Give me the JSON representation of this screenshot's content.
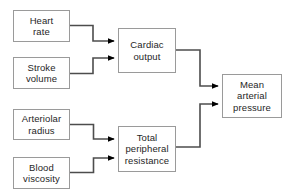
{
  "diagram": {
    "type": "flowchart",
    "canvas": {
      "width": 287,
      "height": 196,
      "background": "#ffffff"
    },
    "style": {
      "box_border_color": "#9a9a9a",
      "box_fill_color": "#ffffff",
      "text_color": "#262626",
      "connector_color": "#4d4d4d",
      "arrowhead_color": "#000000"
    },
    "nodes": [
      {
        "id": "heart-rate",
        "label": "Heart\nrate",
        "x": 13,
        "y": 10,
        "width": 57,
        "height": 32
      },
      {
        "id": "stroke-volume",
        "label": "Stroke\nvolume",
        "x": 13,
        "y": 57,
        "width": 57,
        "height": 32
      },
      {
        "id": "cardiac-output",
        "label": "Cardiac\noutput",
        "x": 118,
        "y": 28,
        "width": 58,
        "height": 45
      },
      {
        "id": "arteriolar-radius",
        "label": "Arteriolar\nradius",
        "x": 13,
        "y": 109,
        "width": 57,
        "height": 31
      },
      {
        "id": "blood-viscosity",
        "label": "Blood\nviscosity",
        "x": 13,
        "y": 157,
        "width": 57,
        "height": 32
      },
      {
        "id": "total-peripheral-resistance",
        "label": "Total\nperipheral\nresistance",
        "x": 118,
        "y": 126,
        "width": 58,
        "height": 46
      },
      {
        "id": "mean-arterial-pressure",
        "label": "Mean\narterial\npressure",
        "x": 222,
        "y": 74,
        "width": 60,
        "height": 44
      }
    ],
    "edges": [
      {
        "id": "heart-rate-to-cardiac-output",
        "from": "heart-rate",
        "to": "cardiac-output"
      },
      {
        "id": "stroke-volume-to-cardiac-output",
        "from": "stroke-volume",
        "to": "cardiac-output"
      },
      {
        "id": "arteriolar-radius-to-tpr",
        "from": "arteriolar-radius",
        "to": "total-peripheral-resistance"
      },
      {
        "id": "blood-viscosity-to-tpr",
        "from": "blood-viscosity",
        "to": "total-peripheral-resistance"
      },
      {
        "id": "cardiac-output-to-map",
        "from": "cardiac-output",
        "to": "mean-arterial-pressure"
      },
      {
        "id": "tpr-to-map",
        "from": "total-peripheral-resistance",
        "to": "mean-arterial-pressure"
      }
    ]
  }
}
